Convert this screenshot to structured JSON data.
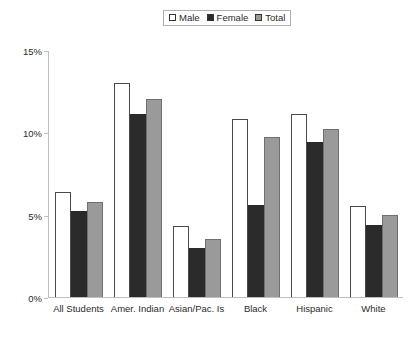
{
  "chart_data": {
    "type": "bar",
    "title": "",
    "xlabel": "",
    "ylabel": "",
    "ylim": [
      0,
      15
    ],
    "yticks": [
      "0%",
      "5%",
      "10%",
      "15%"
    ],
    "ytick_values": [
      0,
      5,
      10,
      15
    ],
    "grid": false,
    "legend_position": "top-center",
    "categories": [
      "All Students",
      "Amer. Indian",
      "Asian/Pac. Is",
      "Black",
      "Hispanic",
      "White"
    ],
    "series": [
      {
        "name": "Male",
        "color": "#ffffff",
        "values": [
          6.4,
          13.0,
          4.3,
          10.8,
          11.1,
          5.5
        ]
      },
      {
        "name": "Female",
        "color": "#2b2b2b",
        "values": [
          5.2,
          11.1,
          3.0,
          5.6,
          9.4,
          4.4
        ]
      },
      {
        "name": "Total",
        "color": "#9a9a9a",
        "values": [
          5.8,
          12.0,
          3.5,
          9.7,
          10.2,
          5.0
        ]
      }
    ]
  },
  "legend": {
    "items": [
      {
        "label": "Male"
      },
      {
        "label": "Female"
      },
      {
        "label": "Total"
      }
    ]
  }
}
